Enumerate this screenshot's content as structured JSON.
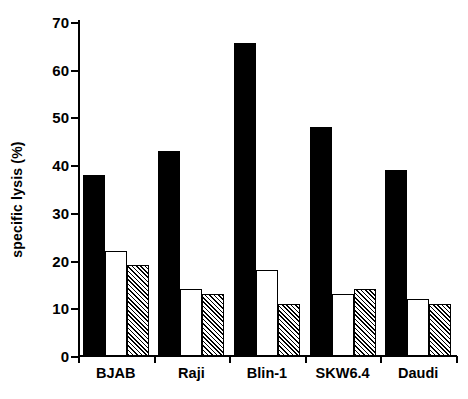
{
  "chart_data": {
    "type": "bar",
    "title": "",
    "xlabel": "",
    "ylabel": "specific lysis (%)",
    "ylim": [
      0,
      70
    ],
    "ytick_step": 10,
    "yticks": [
      0,
      10,
      20,
      30,
      40,
      50,
      60,
      70
    ],
    "grid": false,
    "legend": "none",
    "categories": [
      "BJAB",
      "Raji",
      "Blin-1",
      "SKW6.4",
      "Daudi"
    ],
    "series": [
      {
        "name": "series-1",
        "style": "solid-black",
        "color": "#000000",
        "values": [
          38,
          43,
          65.7,
          48,
          39
        ]
      },
      {
        "name": "series-2",
        "style": "hollow-white",
        "color": "#ffffff",
        "values": [
          22,
          14,
          18,
          13,
          12
        ]
      },
      {
        "name": "series-3",
        "style": "diagonal-hatch",
        "color": "#808080",
        "values": [
          19,
          13,
          11,
          14,
          11
        ]
      }
    ]
  },
  "axis": {
    "y_title": "specific lysis (%)",
    "y_tick_labels": [
      "70",
      "60",
      "50",
      "40",
      "30",
      "20",
      "10",
      "0"
    ],
    "x_tick_labels": [
      "BJAB",
      "Raji",
      "Blin-1",
      "SKW6.4",
      "Daudi"
    ]
  }
}
